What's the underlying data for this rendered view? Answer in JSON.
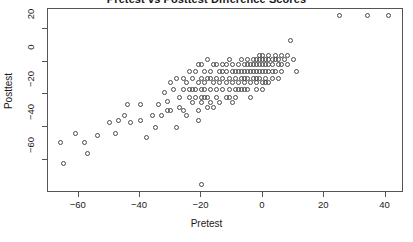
{
  "chart_data": {
    "type": "scatter",
    "title": "Pretest vs Posttest Difference Scores",
    "xlabel": "Pretest",
    "ylabel": "Posttest",
    "xlim": [
      -70,
      46
    ],
    "ylim": [
      -80,
      32
    ],
    "xticks": [
      -60,
      -40,
      -20,
      0,
      20,
      40
    ],
    "yticks": [
      20,
      0,
      -20,
      -40,
      -60
    ],
    "grid": false,
    "legend": null,
    "marker": "open-circle",
    "marker_color": "#4a4a4a",
    "points": [
      [
        -66,
        -49
      ],
      [
        -65,
        -62
      ],
      [
        -61,
        -44
      ],
      [
        -57,
        -56
      ],
      [
        -54,
        -45
      ],
      [
        -48,
        -44
      ],
      [
        -45,
        -33
      ],
      [
        -43,
        -37
      ],
      [
        -40,
        -36
      ],
      [
        -38,
        -46
      ],
      [
        -36,
        -33
      ],
      [
        -34,
        -26
      ],
      [
        -33,
        -33
      ],
      [
        -31,
        -24
      ],
      [
        -30,
        -30
      ],
      [
        -29,
        -17
      ],
      [
        -28,
        -40
      ],
      [
        -27,
        -28
      ],
      [
        -26,
        -17
      ],
      [
        -26,
        -30
      ],
      [
        -25,
        -13
      ],
      [
        -24,
        -22
      ],
      [
        -24,
        -17
      ],
      [
        -23,
        -25
      ],
      [
        -23,
        -10
      ],
      [
        -22,
        -6
      ],
      [
        -22,
        -17
      ],
      [
        -22,
        -22
      ],
      [
        -21,
        -13
      ],
      [
        -21,
        -30
      ],
      [
        -21,
        -36
      ],
      [
        -20,
        -2
      ],
      [
        -20,
        -10
      ],
      [
        -20,
        -17
      ],
      [
        -20,
        -22
      ],
      [
        -20,
        -25
      ],
      [
        -20,
        -75
      ],
      [
        -19,
        -6
      ],
      [
        -19,
        -13
      ],
      [
        -19,
        -17
      ],
      [
        -18,
        -10
      ],
      [
        -18,
        -22
      ],
      [
        -18,
        1
      ],
      [
        -17,
        -6
      ],
      [
        -17,
        -17
      ],
      [
        -17,
        -25
      ],
      [
        -16,
        -13
      ],
      [
        -16,
        -2
      ],
      [
        -15,
        -10
      ],
      [
        -15,
        -17
      ],
      [
        -15,
        -22
      ],
      [
        -14,
        -6
      ],
      [
        -14,
        -13
      ],
      [
        -13,
        -2
      ],
      [
        -13,
        -10
      ],
      [
        -13,
        -17
      ],
      [
        -12,
        -6
      ],
      [
        -12,
        -13
      ],
      [
        -12,
        -22
      ],
      [
        -11,
        1
      ],
      [
        -11,
        -10
      ],
      [
        -11,
        -17
      ],
      [
        -10,
        -2
      ],
      [
        -10,
        -6
      ],
      [
        -10,
        -13
      ],
      [
        -10,
        -25
      ],
      [
        -9,
        -10
      ],
      [
        -9,
        -17
      ],
      [
        -8,
        -2
      ],
      [
        -8,
        -6
      ],
      [
        -8,
        -13
      ],
      [
        -7,
        1
      ],
      [
        -7,
        -6
      ],
      [
        -7,
        -10
      ],
      [
        -7,
        -17
      ],
      [
        -6,
        -2
      ],
      [
        -6,
        -6
      ],
      [
        -6,
        -13
      ],
      [
        -5,
        1
      ],
      [
        -5,
        -2
      ],
      [
        -5,
        -6
      ],
      [
        -5,
        -10
      ],
      [
        -5,
        -17
      ],
      [
        -4,
        -2
      ],
      [
        -4,
        -6
      ],
      [
        -4,
        -13
      ],
      [
        -3,
        1
      ],
      [
        -3,
        -2
      ],
      [
        -3,
        -6
      ],
      [
        -3,
        -10
      ],
      [
        -2,
        1
      ],
      [
        -2,
        -2
      ],
      [
        -2,
        -6
      ],
      [
        -2,
        -13
      ],
      [
        -1,
        4
      ],
      [
        -1,
        1
      ],
      [
        -1,
        -2
      ],
      [
        -1,
        -6
      ],
      [
        -1,
        -10
      ],
      [
        0,
        4
      ],
      [
        0,
        1
      ],
      [
        0,
        -2
      ],
      [
        0,
        -6
      ],
      [
        0,
        -13
      ],
      [
        1,
        1
      ],
      [
        1,
        -2
      ],
      [
        1,
        -6
      ],
      [
        1,
        -10
      ],
      [
        2,
        4
      ],
      [
        2,
        1
      ],
      [
        2,
        -2
      ],
      [
        2,
        -6
      ],
      [
        3,
        1
      ],
      [
        3,
        -2
      ],
      [
        3,
        -10
      ],
      [
        4,
        4
      ],
      [
        4,
        1
      ],
      [
        4,
        -6
      ],
      [
        5,
        1
      ],
      [
        5,
        -2
      ],
      [
        6,
        4
      ],
      [
        6,
        -6
      ],
      [
        7,
        1
      ],
      [
        8,
        4
      ],
      [
        9,
        13
      ],
      [
        10,
        1
      ],
      [
        11,
        -6
      ],
      [
        25,
        28
      ],
      [
        34,
        28
      ],
      [
        41,
        28
      ],
      [
        -50,
        -37
      ],
      [
        -44,
        -26
      ],
      [
        -35,
        -40
      ],
      [
        -32,
        -19
      ],
      [
        -28,
        -10
      ],
      [
        -25,
        -33
      ],
      [
        -14,
        -25
      ],
      [
        -9,
        -22
      ],
      [
        -6,
        -17
      ],
      [
        -2,
        -17
      ],
      [
        2,
        -13
      ],
      [
        5,
        -10
      ],
      [
        -30,
        -13
      ],
      [
        -26,
        -10
      ],
      [
        -18,
        -28
      ],
      [
        -11,
        -22
      ],
      [
        -16,
        -28
      ],
      [
        -4,
        -22
      ],
      [
        0,
        -17
      ],
      [
        6,
        -2
      ],
      [
        -24,
        -6
      ],
      [
        -12,
        -2
      ],
      [
        -8,
        -17
      ],
      [
        3,
        -6
      ],
      [
        -21,
        -2
      ],
      [
        -15,
        -2
      ],
      [
        -9,
        -6
      ],
      [
        -6,
        -10
      ],
      [
        -17,
        -10
      ],
      [
        -13,
        -6
      ],
      [
        -2,
        -10
      ],
      [
        1,
        -13
      ],
      [
        -19,
        -22
      ],
      [
        -23,
        -17
      ],
      [
        -27,
        -22
      ],
      [
        -31,
        -30
      ],
      [
        8,
        -2
      ],
      [
        -40,
        -26
      ],
      [
        -47,
        -36
      ],
      [
        -58,
        -49
      ]
    ]
  }
}
